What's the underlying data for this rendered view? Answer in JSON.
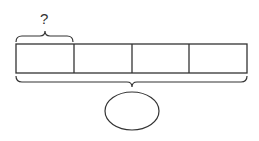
{
  "diagram": {
    "type": "tape-diagram",
    "segments": 4,
    "top_brace_label": "?",
    "bottom_brace_label": "",
    "answer_shape": "ellipse",
    "stroke_color": "#333333"
  }
}
